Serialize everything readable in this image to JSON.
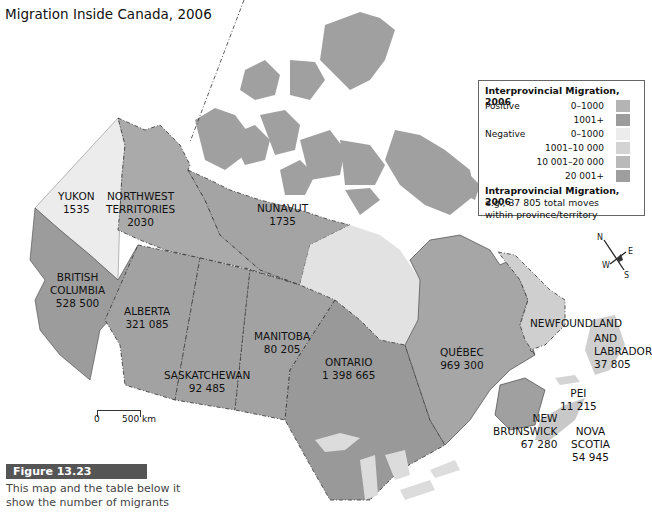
{
  "title": "Migration Inside Canada, 2006",
  "legend": {
    "inter_title": "Interprovincial Migration, 2006",
    "positive_label": "Positive",
    "negative_label": "Negative",
    "positive": [
      {
        "range": "0–1000",
        "color": "#b4b4b4"
      },
      {
        "range": "1001+",
        "color": "#9c9c9c"
      }
    ],
    "negative": [
      {
        "range": "0–1000",
        "color": "#ececec"
      },
      {
        "range": "1001–10 000",
        "color": "#d3d3d3"
      },
      {
        "range": "10 001–20 000",
        "color": "#b9b9b9"
      },
      {
        "range": "20 001+",
        "color": "#9e9e9e"
      }
    ],
    "intra_title": "Intraprovincial Migration, 2006",
    "intra_example_1": "e.g., 37 805 total moves",
    "intra_example_2": "within province/territory"
  },
  "regions": {
    "yukon": {
      "name": "YUKON",
      "value": "1535"
    },
    "nwt": {
      "name1": "NORTHWEST",
      "name2": "TERRITORIES",
      "value": "2030"
    },
    "nunavut": {
      "name": "NUNAVUT",
      "value": "1735"
    },
    "bc": {
      "name1": "BRITISH",
      "name2": "COLUMBIA",
      "value": "528 500"
    },
    "alberta": {
      "name": "ALBERTA",
      "value": "321 085"
    },
    "saskatchewan": {
      "name": "SASKATCHEWAN",
      "value": "92 485"
    },
    "manitoba": {
      "name": "MANITOBA",
      "value": "80 205"
    },
    "ontario": {
      "name": "ONTARIO",
      "value": "1 398 665"
    },
    "quebec": {
      "name": "QUÉBEC",
      "value": "969 300"
    },
    "newfoundland": {
      "name1": "NEWFOUNDLAND",
      "name2": "AND",
      "name3": "LABRADOR",
      "value": "37 805"
    },
    "pei": {
      "name": "PEI",
      "value": "11 215"
    },
    "new_brunswick": {
      "name1": "NEW",
      "name2": "BRUNSWICK",
      "value": "67 280"
    },
    "nova_scotia": {
      "name1": "NOVA",
      "name2": "SCOTIA",
      "value": "54 945"
    }
  },
  "scale": {
    "start": "0",
    "end": "500 km"
  },
  "compass": {
    "n": "N",
    "s": "S",
    "e": "E",
    "w": "W"
  },
  "figure": {
    "label": "Figure 13.23",
    "caption_1": "This map and the table below it",
    "caption_2": "show the number of migrants"
  }
}
